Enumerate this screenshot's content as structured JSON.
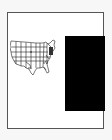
{
  "page": {
    "type": "document-page",
    "border_color": "#555555"
  },
  "figure": {
    "name": "us-states-map",
    "icon": "us-map-icon",
    "stroke_color": "#222222"
  },
  "redaction": {
    "name": "black-rectangle",
    "color": "#000000"
  }
}
